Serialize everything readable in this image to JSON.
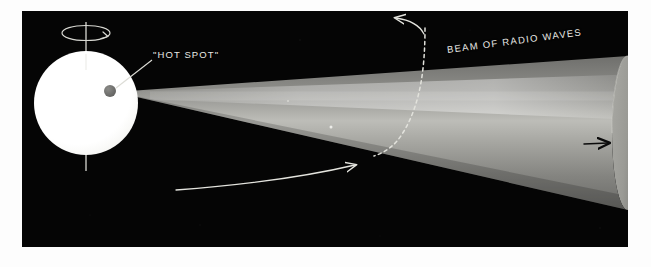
{
  "figure": {
    "kind": "astronomy-illustration",
    "labels": {
      "hot_spot": "\"HOT SPOT\"",
      "beam_of_radio_waves": "BEAM OF RADIO WAVES"
    },
    "colors": {
      "page_background": "#fdfdfd",
      "photo_background": "#050505",
      "star_fill": "#ffffff",
      "hot_spot_fill": "#6e6e6e",
      "cone_fill": "#8a8a8a",
      "cone_highlight": "#c9c9c4",
      "cone_end_face": "#9b9b96",
      "label_text": "#e8e8e4",
      "guide_line": "#d8d8d2",
      "dark_arrow": "#0b0b0b"
    },
    "photo_frame": {
      "x": 22,
      "y": 11,
      "width": 606,
      "height": 236
    },
    "star": {
      "center_x": 86,
      "center_y": 103,
      "radius": 52,
      "name": "neutron-star"
    },
    "rotation_axis": {
      "x": 86,
      "top_y": 22,
      "bottom_y": 171
    },
    "spin_indicator": {
      "center_x": 86,
      "center_y": 33,
      "rx": 24,
      "ry": 7,
      "direction": "clockwise-from-above"
    },
    "hot_spot": {
      "center_x": 110,
      "center_y": 91,
      "radius": 6
    },
    "cone": {
      "apex_x": 115,
      "apex_y": 92,
      "end_x": 628,
      "end_center_y": 133,
      "end_rx": 16,
      "end_ry": 77
    },
    "arrows": {
      "beam_sweep_upper": "curved-arrow-up-left",
      "beam_sweep_lower": "curved-arrow-right",
      "propagation": "arrow-right"
    },
    "dashed_path": "beam-rotation-trace"
  }
}
